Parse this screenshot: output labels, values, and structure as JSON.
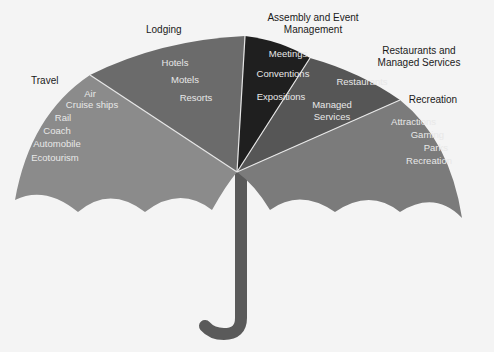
{
  "diagram": {
    "type": "umbrella",
    "colors": {
      "background": "#f4f4f4",
      "travel": "#8b8b8b",
      "lodging": "#6b6b6b",
      "assembly": "#1f1f1f",
      "restaurants": "#565656",
      "recreation": "#7b7b7b",
      "handle": "#5a5a5a",
      "divider": "#e6e6e6"
    },
    "segments": [
      {
        "id": "travel",
        "category": "Travel",
        "items": [
          "Air",
          "Cruise ships",
          "Rail",
          "Coach",
          "Automobile",
          "Ecotourism"
        ]
      },
      {
        "id": "lodging",
        "category": "Lodging",
        "items": [
          "Hotels",
          "Motels",
          "Resorts"
        ]
      },
      {
        "id": "assembly",
        "category_lines": [
          "Assembly and Event",
          "Management"
        ],
        "items": [
          "Meetings",
          "Conventions",
          "Expositions"
        ]
      },
      {
        "id": "restaurants",
        "category_lines": [
          "Restaurants and",
          "Managed Services"
        ],
        "items": [
          "Restaurants",
          "Managed",
          "Services"
        ]
      },
      {
        "id": "recreation",
        "category": "Recreation",
        "items": [
          "Attractions",
          "Gaming",
          "Parks",
          "Recreation"
        ]
      }
    ]
  }
}
